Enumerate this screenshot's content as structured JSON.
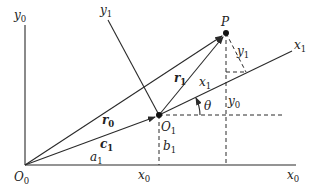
{
  "figure": {
    "type": "coordinate-transformation-diagram",
    "points": {
      "origin_frame0": {
        "label": "O",
        "sub": "0"
      },
      "origin_frame1": {
        "label": "O",
        "sub": "1"
      },
      "point_p": {
        "label": "P"
      }
    },
    "axes": {
      "x0_axis": {
        "label": "x",
        "sub": "0"
      },
      "y0_axis": {
        "label": "y",
        "sub": "0"
      },
      "x1_axis": {
        "label": "x",
        "sub": "1"
      },
      "y1_axis": {
        "label": "y",
        "sub": "1"
      }
    },
    "vectors": {
      "r0": {
        "label": "r",
        "sub": "0"
      },
      "r1": {
        "label": "r",
        "sub": "1"
      },
      "c1": {
        "label": "c",
        "sub": "1"
      }
    },
    "components": {
      "a1": {
        "label": "a",
        "sub": "1"
      },
      "b1": {
        "label": "b",
        "sub": "1"
      },
      "x0_proj": {
        "label": "x",
        "sub": "0"
      },
      "y0_proj": {
        "label": "y",
        "sub": "0"
      },
      "x1_proj": {
        "label": "x",
        "sub": "1"
      },
      "y1_proj": {
        "label": "y",
        "sub": "1"
      }
    },
    "angle": {
      "label": "θ"
    },
    "colors": {
      "ink": "#2a2a2a",
      "background": "#ffffff"
    }
  }
}
